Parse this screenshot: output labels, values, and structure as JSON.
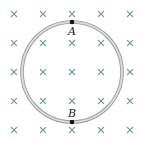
{
  "diagram": {
    "field": {
      "symbol": "×",
      "direction": "into-page",
      "color": "#5fa88f",
      "grid": {
        "xs": [
          14,
          43,
          72,
          101,
          130
        ],
        "ys": [
          14,
          43,
          72,
          101,
          130
        ]
      }
    },
    "loop": {
      "cx": 72,
      "cy": 72,
      "r": 50,
      "fill_color": "#d9d9d9",
      "edge_color": "#9a9a9a"
    },
    "points": [
      {
        "label": "A",
        "x": 72,
        "y": 22,
        "label_x": 68,
        "label_y": 35
      },
      {
        "label": "B",
        "x": 72,
        "y": 122,
        "label_x": 68,
        "label_y": 117
      }
    ]
  }
}
